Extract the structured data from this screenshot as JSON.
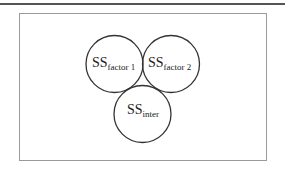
{
  "diagram": {
    "type": "venn-circles",
    "circles": [
      {
        "id": "factor1",
        "main": "SS",
        "sub": "factor 1"
      },
      {
        "id": "factor2",
        "main": "SS",
        "sub": "factor 2"
      },
      {
        "id": "inter",
        "main": "SS",
        "sub": "inter"
      }
    ]
  }
}
